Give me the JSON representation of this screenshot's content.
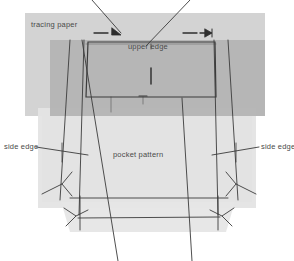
{
  "figure": {
    "kind": "sewing-pattern-diagram",
    "title_visible": false,
    "background_color": "#ffffff",
    "line_color": "#3b3b3b",
    "text_color": "#4a4a4a",
    "width": 294,
    "height": 261
  },
  "labels": {
    "tracing_paper": "tracing paper",
    "upper_edge": "upper edge",
    "pocket_pattern": "pocket pattern",
    "side_edge_left": "side edge",
    "side_edge_right": "side edge"
  },
  "layers": [
    {
      "name": "tracing-paper-sheet",
      "color": "#cfcfcf",
      "opacity": 0.9,
      "x": 25,
      "y": 13,
      "width": 240,
      "height": 103
    },
    {
      "name": "pattern-paper-sheet",
      "color": "#b4b4b4",
      "opacity": 0.95,
      "x": 50,
      "y": 40,
      "width": 215,
      "height": 76
    },
    {
      "name": "fabric-body-sheet",
      "color": "#e2e2e2",
      "opacity": 0.95,
      "x": 38,
      "y": 116,
      "width": 218,
      "height": 90
    },
    {
      "name": "fabric-hem-sheet",
      "color": "#e8e8e8",
      "opacity": 0.95,
      "x": 58,
      "y": 198,
      "width": 178,
      "height": 34
    }
  ],
  "marks": {
    "grain_tick": {
      "name": "center-grain-tick",
      "x": 151,
      "y1": 68,
      "y2": 84
    },
    "arrow_left": {
      "name": "left-seam-allowance-arrow",
      "dash_x1": 95,
      "dash_x2": 108,
      "y": 33,
      "tip_x": 120
    },
    "arrow_right": {
      "name": "right-seam-allowance-arrow",
      "dash_x1": 183,
      "dash_x2": 196,
      "y": 33,
      "tip_x": 210
    }
  },
  "leader_lines": [
    {
      "name": "leader-top-left",
      "x1": 92,
      "y1": 0,
      "x2": 120,
      "y2": 33
    },
    {
      "name": "leader-top-right",
      "x1": 188,
      "y1": 0,
      "x2": 148,
      "y2": 44
    },
    {
      "name": "leader-bottom-left",
      "x1": 118,
      "y1": 261,
      "x2": 82,
      "y2": 40
    },
    {
      "name": "leader-bottom-right",
      "x1": 192,
      "y1": 261,
      "x2": 182,
      "y2": 98
    },
    {
      "name": "leader-side-edge-left",
      "x1": 37,
      "y1": 147,
      "x2": 86,
      "y2": 154
    },
    {
      "name": "leader-side-edge-right",
      "x1": 258,
      "y1": 147,
      "x2": 214,
      "y2": 154
    }
  ],
  "colors": {
    "sheet_light": "#e2e2e2",
    "sheet_mid": "#cfcfcf",
    "sheet_dark": "#b4b4b4",
    "ink": "#3b3b3b",
    "text": "#4a4a4a"
  }
}
